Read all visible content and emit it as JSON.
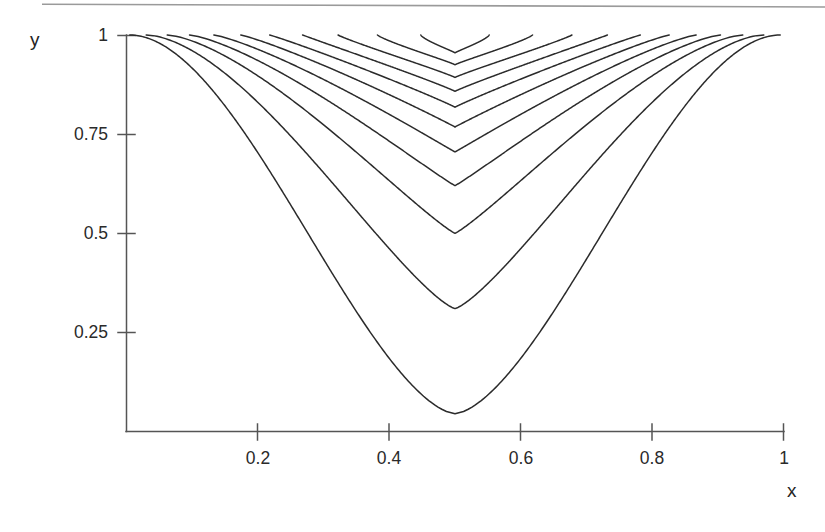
{
  "figure": {
    "kind": "contour-plot",
    "background": "#ffffff",
    "line_color": "#2b2b2b",
    "axis_color": "#555555",
    "rule_color": "#9a9a9a"
  },
  "axes": {
    "x": {
      "label": "x",
      "ticks": [
        {
          "value": 0.2,
          "label": "0.2"
        },
        {
          "value": 0.4,
          "label": "0.4"
        },
        {
          "value": 0.6,
          "label": "0.6"
        },
        {
          "value": 0.8,
          "label": "0.8"
        },
        {
          "value": 1.0,
          "label": "1"
        }
      ],
      "range": [
        0,
        1
      ]
    },
    "y": {
      "label": "y",
      "ticks": [
        {
          "value": 0.25,
          "label": "0.25"
        },
        {
          "value": 0.5,
          "label": "0.5"
        },
        {
          "value": 0.75,
          "label": "0.75"
        },
        {
          "value": 1.0,
          "label": "1"
        }
      ],
      "range": [
        0,
        1
      ]
    }
  },
  "chart_data": {
    "type": "line",
    "title": "",
    "subtitle": "",
    "xlabel": "x",
    "ylabel": "y",
    "xlim": [
      0,
      1
    ],
    "ylim": [
      0,
      1
    ],
    "grid": false,
    "legend": null,
    "xticks": [
      0.2,
      0.4,
      0.6,
      0.8,
      1.0
    ],
    "yticks": [
      0.25,
      0.5,
      0.75,
      1.0
    ],
    "n_contours": 11,
    "series": [
      {
        "name": "contour-1",
        "min_y": 0.045,
        "top_x_left": 0.005,
        "top_x_right": 0.995
      },
      {
        "name": "contour-2",
        "min_y": 0.31,
        "top_x_left": 0.03,
        "top_x_right": 0.97
      },
      {
        "name": "contour-3",
        "min_y": 0.5,
        "top_x_left": 0.062,
        "top_x_right": 0.938
      },
      {
        "name": "contour-4",
        "min_y": 0.62,
        "top_x_left": 0.096,
        "top_x_right": 0.904
      },
      {
        "name": "contour-5",
        "min_y": 0.705,
        "top_x_left": 0.133,
        "top_x_right": 0.867
      },
      {
        "name": "contour-6",
        "min_y": 0.768,
        "top_x_left": 0.174,
        "top_x_right": 0.826
      },
      {
        "name": "contour-7",
        "min_y": 0.818,
        "top_x_left": 0.218,
        "top_x_right": 0.782
      },
      {
        "name": "contour-8",
        "min_y": 0.858,
        "top_x_left": 0.268,
        "top_x_right": 0.732
      },
      {
        "name": "contour-9",
        "min_y": 0.893,
        "top_x_left": 0.322,
        "top_x_right": 0.678
      },
      {
        "name": "contour-10",
        "min_y": 0.925,
        "top_x_left": 0.382,
        "top_x_right": 0.618
      },
      {
        "name": "contour-11",
        "min_y": 0.955,
        "top_x_left": 0.448,
        "top_x_right": 0.552
      }
    ]
  }
}
